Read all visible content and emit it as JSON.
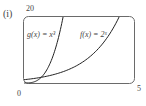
{
  "panel_label": "(i)",
  "chart_data": {
    "type": "line",
    "title": "",
    "xlabel": "",
    "ylabel": "",
    "xlim": [
      0,
      5
    ],
    "ylim": [
      0,
      20
    ],
    "x_tick_labels": [
      "0",
      "5"
    ],
    "y_tick_labels": [
      "20"
    ],
    "grid": false,
    "series": [
      {
        "name": "g(x) = x³",
        "label": "g(x) = x³",
        "x": [
          0,
          0.5,
          1,
          1.5,
          2,
          2.5,
          2.71
        ],
        "values": [
          0,
          0.125,
          1,
          3.375,
          8,
          15.625,
          20
        ]
      },
      {
        "name": "f(x) = 2ˣ",
        "label": "f(x) = 2ˣ",
        "x": [
          0,
          0.5,
          1,
          1.5,
          2,
          2.5,
          3,
          3.5,
          4,
          4.32
        ],
        "values": [
          1,
          1.41,
          2,
          2.83,
          4,
          5.66,
          8,
          11.31,
          16,
          20
        ]
      }
    ],
    "annotations": [
      {
        "text": "g(x) = x³",
        "near": "left curve"
      },
      {
        "text": "f(x) = 2ˣ",
        "near": "right curve"
      }
    ]
  },
  "labels": {
    "y_max": "20",
    "x_min": "0",
    "x_max": "5",
    "g_label": "g(x) = x³",
    "f_label": "f(x) = 2ˣ"
  },
  "colors": {
    "frame": "#555555",
    "curve": "#222222",
    "text": "#444444"
  }
}
